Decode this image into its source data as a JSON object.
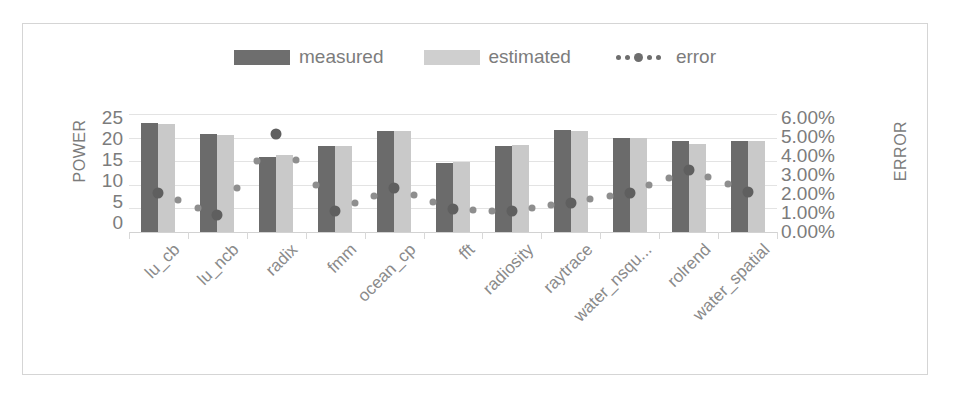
{
  "legend": {
    "position": "top-center",
    "entries": [
      {
        "label": "measured",
        "icon": "bar-swatch-dark",
        "color": "#6e6e6e"
      },
      {
        "label": "estimated",
        "icon": "bar-swatch-light",
        "color": "#cfcfcf"
      },
      {
        "label": "error",
        "icon": "dotted-line-marker",
        "color": "#6e6e6e"
      }
    ]
  },
  "axes": {
    "y_left": {
      "title": "POWER",
      "ticks": [
        "25",
        "20",
        "15",
        "10",
        "5",
        "0"
      ]
    },
    "y_right": {
      "title": "ERROR",
      "ticks": [
        "6.00%",
        "5.00%",
        "4.00%",
        "3.00%",
        "2.00%",
        "1.00%",
        "0.00%"
      ]
    }
  },
  "chart_data": {
    "type": "bar",
    "title": "",
    "xlabel": "",
    "ylabel": "POWER",
    "y2label": "ERROR",
    "ylim": [
      0,
      25
    ],
    "y2lim": [
      0,
      0.06
    ],
    "grid": true,
    "legend_position": "top-center",
    "categories": [
      "lu_cb",
      "lu_ncb",
      "radix",
      "fmm",
      "ocean_cp",
      "fft",
      "radiosity",
      "raytrace",
      "water_nsqu...",
      "rolrend",
      "water_spatial"
    ],
    "series": [
      {
        "name": "measured",
        "axis": "left",
        "color": "#6b6b6b",
        "values": [
          23.0,
          20.8,
          15.9,
          18.2,
          21.5,
          14.7,
          18.2,
          21.7,
          20.0,
          19.2,
          19.2
        ]
      },
      {
        "name": "estimated",
        "axis": "left",
        "color": "#c9c9c9",
        "values": [
          22.8,
          20.6,
          16.4,
          18.2,
          21.3,
          14.8,
          18.4,
          21.4,
          20.0,
          18.7,
          19.3
        ]
      },
      {
        "name": "error",
        "axis": "right",
        "color": "#6d6d6d",
        "unit": "%",
        "values": [
          0.02,
          0.0085,
          0.05,
          0.0105,
          0.0225,
          0.0115,
          0.0105,
          0.015,
          0.02,
          0.0315,
          0.0205
        ]
      }
    ]
  }
}
